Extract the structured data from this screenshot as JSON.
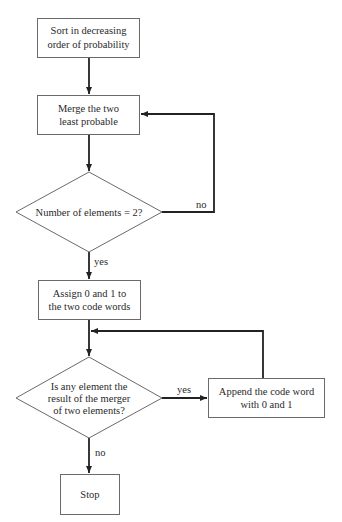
{
  "diagram": {
    "type": "flowchart",
    "nodes": [
      {
        "id": "sort",
        "shape": "rect",
        "lines": [
          "Sort in decreasing",
          "order of probability"
        ]
      },
      {
        "id": "merge",
        "shape": "rect",
        "lines": [
          "Merge the two",
          "least probable"
        ]
      },
      {
        "id": "check_count",
        "shape": "diamond",
        "lines": [
          "Number of elements = 2?"
        ]
      },
      {
        "id": "assign",
        "shape": "rect",
        "lines": [
          "Assign 0 and 1 to",
          "the two code words"
        ]
      },
      {
        "id": "check_merged",
        "shape": "diamond",
        "lines": [
          "Is any element the",
          "result of the merger",
          "of two elements?"
        ]
      },
      {
        "id": "append",
        "shape": "rect",
        "lines": [
          "Append the code word",
          "with 0 and 1"
        ]
      },
      {
        "id": "stop",
        "shape": "rect",
        "lines": [
          "Stop"
        ]
      }
    ],
    "edges": [
      {
        "from": "sort",
        "to": "merge",
        "label": ""
      },
      {
        "from": "merge",
        "to": "check_count",
        "label": ""
      },
      {
        "from": "check_count",
        "to": "merge",
        "label": "no"
      },
      {
        "from": "check_count",
        "to": "assign",
        "label": "yes"
      },
      {
        "from": "assign",
        "to": "check_merged",
        "label": ""
      },
      {
        "from": "check_merged",
        "to": "append",
        "label": "yes"
      },
      {
        "from": "append",
        "to": "check_merged",
        "label": ""
      },
      {
        "from": "check_merged",
        "to": "stop",
        "label": "no"
      }
    ],
    "colors": {
      "line": "#222222",
      "border": "#6a6a6a",
      "text": "#2a2a2a",
      "background": "#ffffff"
    }
  }
}
